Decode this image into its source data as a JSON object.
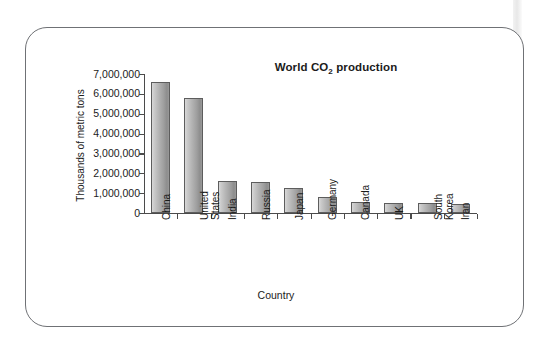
{
  "figure": {
    "title_prefix": "World CO",
    "title_sub": "2",
    "title_suffix": " production",
    "title_full": "World CO2 production"
  },
  "chart_data": {
    "type": "bar",
    "title": "World CO2 production",
    "xlabel": "Country",
    "ylabel": "Thousands of metric tons",
    "categories": [
      "China",
      "United States",
      "India",
      "Russia",
      "Japan",
      "Germany",
      "Canada",
      "UK",
      "South Korea",
      "Iran"
    ],
    "category_lines": [
      [
        "China"
      ],
      [
        "United",
        "States"
      ],
      [
        "India"
      ],
      [
        "Russia"
      ],
      [
        "Japan"
      ],
      [
        "Germany"
      ],
      [
        "Canada"
      ],
      [
        "UK"
      ],
      [
        "South",
        "Korea"
      ],
      [
        "Iran"
      ]
    ],
    "values": [
      6600000,
      5800000,
      1600000,
      1550000,
      1250000,
      800000,
      550000,
      520000,
      520000,
      450000
    ],
    "ylim": [
      0,
      7000000
    ],
    "ytick_values": [
      0,
      1000000,
      2000000,
      3000000,
      4000000,
      5000000,
      6000000,
      7000000
    ],
    "ytick_labels": [
      "0",
      "1,000,000",
      "2,000,000",
      "3,000,000",
      "4,000,000",
      "5,000,000",
      "6,000,000",
      "7,000,000"
    ],
    "grid": false,
    "legend": null,
    "bar_color": "#b0b0b0",
    "bar_edge_color": "#5d5d5d",
    "axis_color": "#4b4b4b"
  }
}
